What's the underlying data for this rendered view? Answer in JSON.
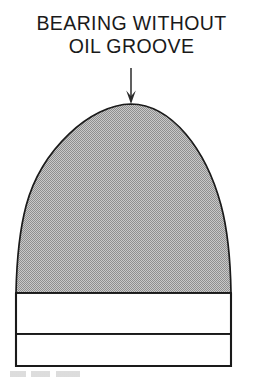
{
  "figure": {
    "caption_line_1": "BEARING WITHOUT",
    "caption_line_2": "OIL GROOVE",
    "annotation_arrow": "down-arrow",
    "colors": {
      "background": "#ffffff",
      "outline": "#1a1a1a",
      "shaded_fill": "#b0b0b0",
      "unshaded_fill": "#ffffff",
      "text": "#1a1a1a"
    },
    "parts": [
      {
        "name": "bearing-dome",
        "fill": "shaded",
        "description": "Parabolic dome cross-section of bearing, halftone grey shading"
      },
      {
        "name": "bearing-body-upper",
        "fill": "unshaded",
        "description": "Upper rectangular band of bearing base, white"
      },
      {
        "name": "bearing-body-lower",
        "fill": "unshaded",
        "description": "Lower rectangular band of bearing base, white"
      }
    ],
    "geometry": {
      "dome_apex": [
        131,
        104
      ],
      "dome_base_y": 293,
      "body_left_x": 16,
      "body_right_x": 231,
      "body_divider_y": 334,
      "body_bottom_y": 366,
      "arrow_x": 131,
      "arrow_top_y": 68,
      "arrow_tip_y": 104
    }
  }
}
